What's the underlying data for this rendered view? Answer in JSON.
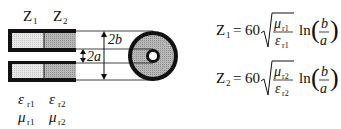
{
  "diagram": {
    "labels": {
      "z1": "Z",
      "z1_sub": "1",
      "z2": "Z",
      "z2_sub": "2",
      "dim_outer": "2b",
      "dim_inner": "2a",
      "eps1": "ε",
      "eps1_sub": "r1",
      "eps2": "ε",
      "eps2_sub": "r2",
      "mu1": "μ",
      "mu1_sub": "r1",
      "mu2": "μ",
      "mu2_sub": "r2"
    },
    "colors": {
      "outline": "#111111",
      "section1_fill": "#dcdcdc",
      "section2_fill": "#a8a8a8",
      "coax_fill": "#b4b4b4"
    }
  },
  "equations": [
    {
      "lhs": "Z",
      "lhs_sub": "1",
      "equals": "=",
      "coef": "60",
      "num": "μ",
      "num_sub": "r1",
      "den": "ε",
      "den_sub": "r1",
      "fn": "ln",
      "frac_num": "b",
      "frac_den": "a"
    },
    {
      "lhs": "Z",
      "lhs_sub": "2",
      "equals": "=",
      "coef": "60",
      "num": "μ",
      "num_sub": "r2",
      "den": "ε",
      "den_sub": "r2",
      "fn": "ln",
      "frac_num": "b",
      "frac_den": "a"
    }
  ]
}
